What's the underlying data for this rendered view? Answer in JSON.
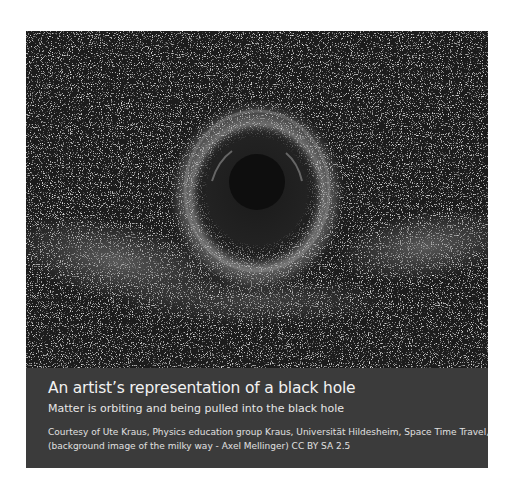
{
  "figure": {
    "image": {
      "description": "Black hole with swirling accretion ring against starfield and milky way band",
      "colors": {
        "background": "#1c1c1c",
        "ring": "#9a9a9a",
        "hole": "#0d0d0d",
        "band": "#7a7a7a"
      }
    },
    "caption": {
      "title": "An artist’s representation of a black hole",
      "subtitle": "Matter is orbiting and being pulled into the black hole",
      "credit_line1": "Courtesy of Ute Kraus, Physics education group Kraus, Universität Hildesheim, Space Time Travel,",
      "credit_line2": "(background image of the milky way -  Axel Mellinger)   CC BY SA 2.5",
      "background": "#3b3b3b"
    }
  }
}
